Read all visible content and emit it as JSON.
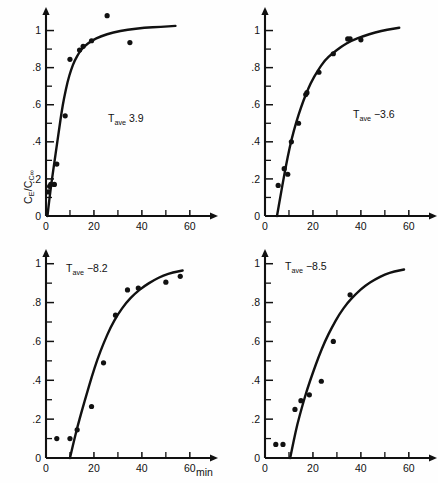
{
  "figure": {
    "y_axis_label_html": "C<sub>E</sub>/C<sub>C∞</sub>",
    "x_axis_label": "min",
    "panel_count": 4
  },
  "chart_data": [
    {
      "type": "scatter",
      "panel": "top-left",
      "title": "",
      "annotation": "T_ave 3.9",
      "annotation_prefix": "T",
      "annotation_sub": "ave",
      "annotation_value": "3.9",
      "xlabel": "",
      "ylabel": "CE/CC∞",
      "xlim": [
        0,
        68
      ],
      "ylim": [
        0,
        1.1
      ],
      "xticks": [
        0,
        20,
        40,
        60
      ],
      "xticks_minor": [
        10,
        30,
        50
      ],
      "yticks": [
        0,
        0.2,
        0.4,
        0.6,
        0.8,
        1
      ],
      "yticklabels": [
        "0",
        ".2",
        ".4",
        ".6",
        ".8",
        "1"
      ],
      "yticks_minor": [
        0.1,
        0.3,
        0.5,
        0.7,
        0.9
      ],
      "grid": false,
      "legend": "none",
      "x": [
        1.0,
        1.5,
        2.0,
        3.5,
        4.5,
        8.0,
        10.0,
        14.0,
        15.5,
        19.0,
        25.5,
        35.0
      ],
      "y": [
        0.13,
        0.16,
        0.17,
        0.17,
        0.28,
        0.54,
        0.845,
        0.895,
        0.915,
        0.945,
        1.08,
        0.935
      ],
      "curve_x": [
        0.6,
        1.5,
        2.5,
        3.5,
        4.5,
        5.5,
        6.5,
        7.5,
        9.0,
        10.5,
        12.0,
        14.0,
        16.0,
        19.0,
        23.0,
        28.0,
        34.0,
        41.0,
        48.0,
        54.0
      ],
      "curve_y": [
        0.0,
        0.1,
        0.2,
        0.29,
        0.38,
        0.47,
        0.56,
        0.635,
        0.725,
        0.79,
        0.84,
        0.885,
        0.915,
        0.945,
        0.97,
        0.99,
        1.005,
        1.015,
        1.02,
        1.025
      ]
    },
    {
      "type": "scatter",
      "panel": "top-right",
      "title": "",
      "annotation": "T_ave −3.6",
      "annotation_prefix": "T",
      "annotation_sub": "ave",
      "annotation_value": "−3.6",
      "xlabel": "",
      "ylabel": "",
      "xlim": [
        0,
        68
      ],
      "ylim": [
        0,
        1.1
      ],
      "xticks": [
        0,
        20,
        40,
        60
      ],
      "xticks_minor": [
        10,
        30,
        50
      ],
      "yticks": [
        0,
        0.2,
        0.4,
        0.6,
        0.8,
        1
      ],
      "yticklabels": [
        "0",
        ".2",
        ".4",
        ".6",
        ".8",
        "1"
      ],
      "yticks_minor": [
        0.1,
        0.3,
        0.5,
        0.7,
        0.9
      ],
      "grid": false,
      "legend": "none",
      "x": [
        5.5,
        8.0,
        9.5,
        11.0,
        14.0,
        17.0,
        17.5,
        22.5,
        28.5,
        34.5,
        35.5,
        40.0
      ],
      "y": [
        0.165,
        0.255,
        0.225,
        0.4,
        0.5,
        0.655,
        0.665,
        0.775,
        0.875,
        0.955,
        0.955,
        0.95
      ],
      "curve_x": [
        5.0,
        6.5,
        8.0,
        9.5,
        11.0,
        13.0,
        15.0,
        17.0,
        19.0,
        22.0,
        25.0,
        28.0,
        32.0,
        36.0,
        41.0,
        46.0,
        51.0,
        56.0
      ],
      "curve_y": [
        0.0,
        0.11,
        0.22,
        0.32,
        0.41,
        0.505,
        0.585,
        0.655,
        0.715,
        0.785,
        0.84,
        0.875,
        0.915,
        0.945,
        0.97,
        0.99,
        1.005,
        1.015
      ]
    },
    {
      "type": "scatter",
      "panel": "bottom-left",
      "title": "",
      "annotation": "T_ave −8.2",
      "annotation_prefix": "T",
      "annotation_sub": "ave",
      "annotation_value": "−8.2",
      "xlabel": "",
      "ylabel": "",
      "xlim": [
        0,
        68
      ],
      "ylim": [
        0,
        1.05
      ],
      "xticks": [
        0,
        20,
        40,
        60
      ],
      "xticks_minor": [
        10,
        30,
        50
      ],
      "yticks": [
        0,
        0.2,
        0.4,
        0.6,
        0.8,
        1
      ],
      "yticklabels": [
        "0",
        ".2",
        ".4",
        ".6",
        ".8",
        "1"
      ],
      "yticks_minor": [
        0.1,
        0.3,
        0.5,
        0.7,
        0.9
      ],
      "grid": false,
      "legend": "none",
      "x": [
        4.5,
        10.0,
        13.0,
        19.0,
        24.0,
        29.0,
        34.0,
        38.5,
        50.0,
        56.0
      ],
      "y": [
        0.1,
        0.1,
        0.145,
        0.265,
        0.49,
        0.735,
        0.865,
        0.875,
        0.905,
        0.935
      ],
      "curve_x": [
        10.0,
        11.5,
        13.0,
        15.0,
        17.0,
        19.0,
        21.5,
        24.0,
        27.0,
        30.0,
        33.5,
        37.0,
        41.0,
        45.0,
        49.0,
        53.0,
        57.0
      ],
      "curve_y": [
        0.0,
        0.08,
        0.155,
        0.245,
        0.33,
        0.415,
        0.51,
        0.59,
        0.675,
        0.74,
        0.8,
        0.845,
        0.885,
        0.915,
        0.94,
        0.955,
        0.965
      ]
    },
    {
      "type": "scatter",
      "panel": "bottom-right",
      "title": "",
      "annotation": "T_ave −8.5",
      "annotation_prefix": "T",
      "annotation_sub": "ave",
      "annotation_value": "−8.5",
      "xlabel": "min",
      "ylabel": "",
      "xlim": [
        0,
        68
      ],
      "ylim": [
        0,
        1.05
      ],
      "xticks": [
        0,
        20,
        40,
        60
      ],
      "xticks_minor": [
        10,
        30,
        50
      ],
      "yticks": [
        0,
        0.2,
        0.4,
        0.6,
        0.8,
        1
      ],
      "yticklabels": [
        "0",
        ".2",
        ".4",
        ".6",
        ".8",
        "1"
      ],
      "yticks_minor": [
        0.1,
        0.3,
        0.5,
        0.7,
        0.9
      ],
      "grid": false,
      "legend": "none",
      "x": [
        4.5,
        7.5,
        12.5,
        15.0,
        18.5,
        23.5,
        28.5,
        35.5
      ],
      "y": [
        0.07,
        0.07,
        0.25,
        0.295,
        0.325,
        0.395,
        0.6,
        0.84
      ],
      "curve_x": [
        10.5,
        12.0,
        13.5,
        15.5,
        17.5,
        20.0,
        22.5,
        25.0,
        28.0,
        31.0,
        34.5,
        38.0,
        42.0,
        46.0,
        50.0,
        54.0,
        58.0
      ],
      "curve_y": [
        0.0,
        0.09,
        0.175,
        0.265,
        0.35,
        0.44,
        0.525,
        0.6,
        0.675,
        0.74,
        0.8,
        0.845,
        0.89,
        0.92,
        0.945,
        0.96,
        0.97
      ]
    }
  ]
}
